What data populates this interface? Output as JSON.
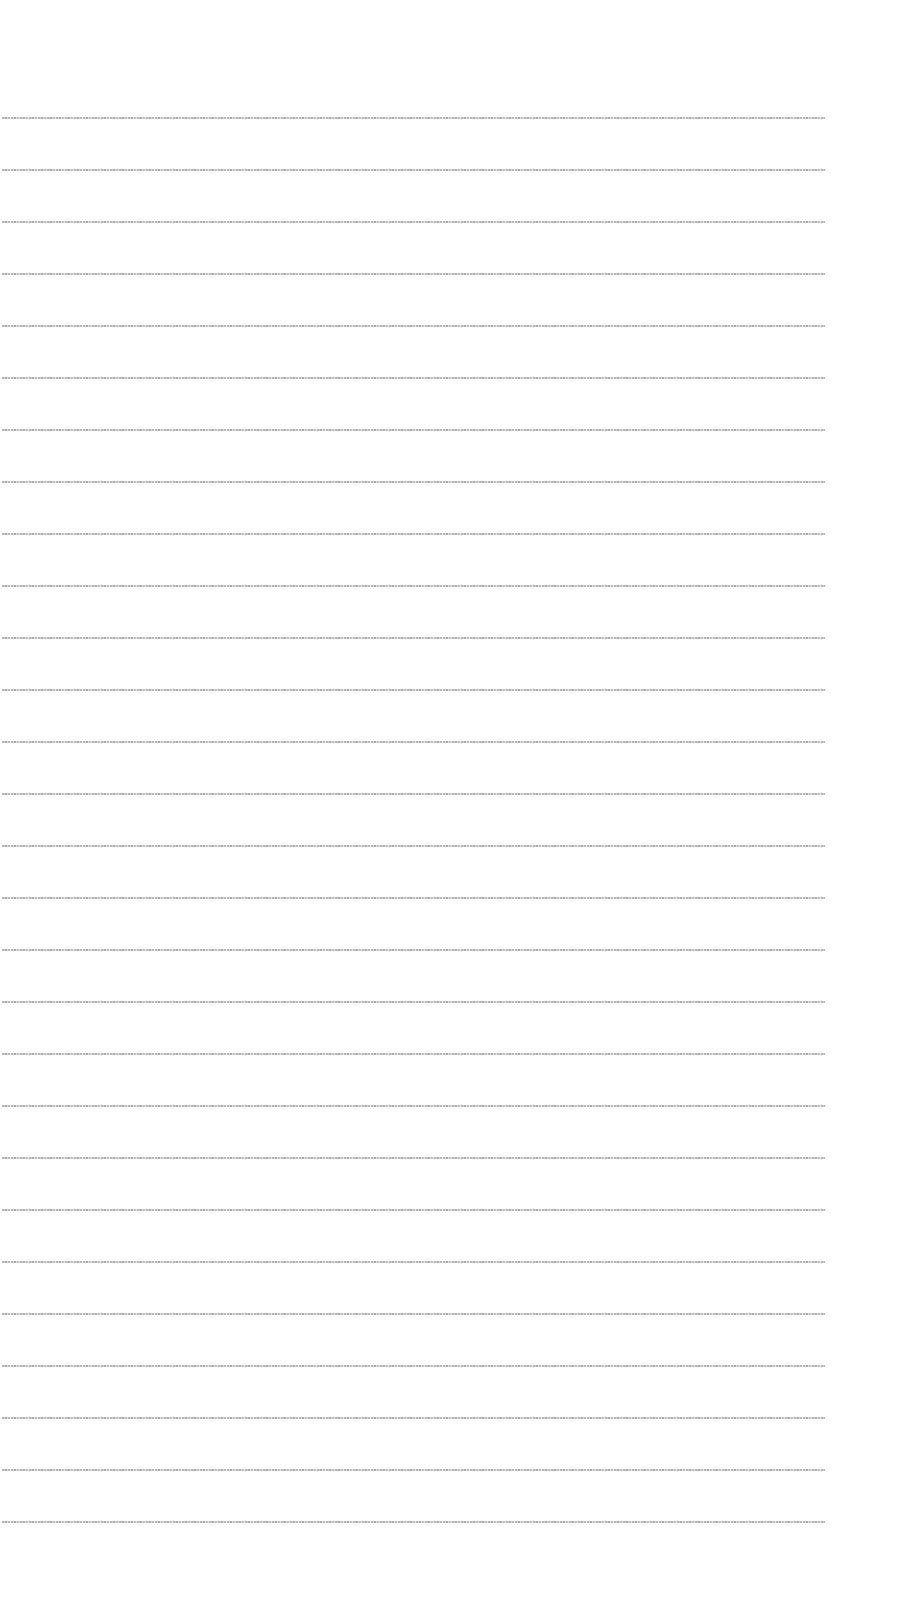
{
  "document": {
    "background": "#ffffff",
    "text_color": "#9a9a9a",
    "line_count": 28,
    "line_spacing_px": 52,
    "first_line_top_px": 116,
    "lines": [
      {
        "text": "[unreadable]"
      },
      {
        "text": "[unreadable]"
      },
      {
        "text": "[unreadable]"
      },
      {
        "text": "[unreadable]"
      },
      {
        "text": "[unreadable]"
      },
      {
        "text": "[unreadable]"
      },
      {
        "text": "[unreadable]"
      },
      {
        "text": "[unreadable]"
      },
      {
        "text": "[unreadable]"
      },
      {
        "text": "[unreadable]"
      },
      {
        "text": "[unreadable]"
      },
      {
        "text": "[unreadable]"
      },
      {
        "text": "[unreadable]"
      },
      {
        "text": "[unreadable]"
      },
      {
        "text": "[unreadable]"
      },
      {
        "text": "[unreadable]"
      },
      {
        "text": "[unreadable]"
      },
      {
        "text": "[unreadable]"
      },
      {
        "text": "[unreadable]"
      },
      {
        "text": "[unreadable]"
      },
      {
        "text": "[unreadable]"
      },
      {
        "text": "[unreadable]"
      },
      {
        "text": "[unreadable]"
      },
      {
        "text": "[unreadable]"
      },
      {
        "text": "[unreadable]"
      },
      {
        "text": "[unreadable]"
      },
      {
        "text": "[unreadable]"
      },
      {
        "text": "[unreadable]"
      }
    ]
  }
}
